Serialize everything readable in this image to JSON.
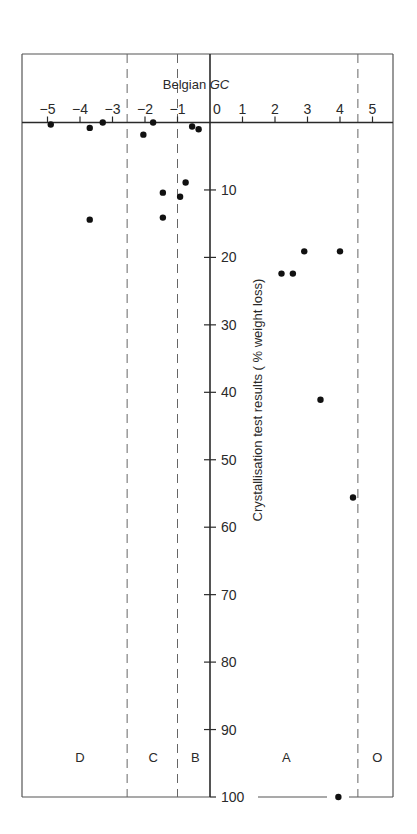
{
  "chart_data": {
    "type": "scatter",
    "title": "",
    "xlabel": "Belgian GC",
    "xlabel_parts": {
      "plain": "Belgian",
      "italic": "GC"
    },
    "ylabel": "Crystallisation test results ( % weight loss)",
    "xlim": [
      -5.5,
      5.7
    ],
    "ylim": [
      0,
      100
    ],
    "y_inverted": true,
    "x_axis_position": "top",
    "grid": false,
    "x_ticks": [
      -5,
      -4,
      -3,
      -2,
      -1,
      0,
      1,
      2,
      3,
      4,
      5
    ],
    "x_tick_labels": [
      "−5",
      "−4",
      "−3",
      "−2",
      "−1",
      "0",
      "1",
      "2",
      "3",
      "4",
      "5"
    ],
    "y_ticks": [
      10,
      20,
      30,
      40,
      50,
      60,
      70,
      80,
      90,
      100
    ],
    "y_tick_labels": [
      "10",
      "20",
      "30",
      "40",
      "50",
      "60",
      "70",
      "80",
      "90",
      "100"
    ],
    "zone_boundaries": [
      -2.55,
      -1.0,
      4.55
    ],
    "zones": [
      {
        "label": "D",
        "x_center": -4.0
      },
      {
        "label": "C",
        "x_center": -1.75
      },
      {
        "label": "B",
        "x_center": -0.45
      },
      {
        "label": "A",
        "x_center": 2.35
      },
      {
        "label": "O",
        "x_center": 5.15
      }
    ],
    "points": [
      {
        "x": -4.9,
        "y": 0.3
      },
      {
        "x": -3.7,
        "y": 0.8
      },
      {
        "x": -3.3,
        "y": 0.0
      },
      {
        "x": -2.05,
        "y": 1.8
      },
      {
        "x": -1.75,
        "y": 0.0
      },
      {
        "x": -0.55,
        "y": 0.6
      },
      {
        "x": -0.35,
        "y": 1.0
      },
      {
        "x": -0.75,
        "y": 8.9
      },
      {
        "x": -1.45,
        "y": 10.4
      },
      {
        "x": -0.92,
        "y": 11.0
      },
      {
        "x": -1.45,
        "y": 14.1
      },
      {
        "x": -3.7,
        "y": 14.4
      },
      {
        "x": 2.2,
        "y": 22.4
      },
      {
        "x": 2.55,
        "y": 22.4
      },
      {
        "x": 2.9,
        "y": 19.1
      },
      {
        "x": 4.0,
        "y": 19.1
      },
      {
        "x": 3.4,
        "y": 41.1
      },
      {
        "x": 4.4,
        "y": 55.6
      },
      {
        "x": 3.95,
        "y": 100
      }
    ]
  },
  "colors": {
    "ink": "#2a2a2a",
    "frame": "#555555",
    "background": "#ffffff"
  }
}
